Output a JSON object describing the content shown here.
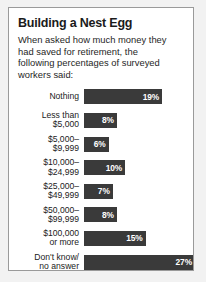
{
  "card": {
    "title": "Building a Nest Egg",
    "subtitle_lines": [
      "When asked how much money they",
      "had saved for retirement, the",
      "following percentages of surveyed",
      "workers said:"
    ]
  },
  "colors": {
    "bar_fill": "#3a3a3a",
    "card_background": "#ffffff",
    "card_border": "#9a9a9a",
    "page_background": "#f2f2f2",
    "value_text": "#ffffff",
    "label_text": "#1b1b1b"
  },
  "chart_data": {
    "type": "bar",
    "orientation": "horizontal",
    "title": "Building a Nest Egg",
    "subtitle": "When asked how much money they had saved for retirement, the following percentages of surveyed workers said:",
    "xlabel": "",
    "ylabel": "",
    "xlim": [
      0,
      27
    ],
    "grid": false,
    "legend": false,
    "value_suffix": "%",
    "categories": [
      "Nothing",
      "Less than $5,000",
      "$5,000–$9,999",
      "$10,000–$24,999",
      "$25,000–$49,999",
      "$50,000–$99,999",
      "$100,000 or more",
      "Don't know/ no answer"
    ],
    "values": [
      19,
      8,
      6,
      10,
      7,
      8,
      15,
      27
    ],
    "value_labels": [
      "19%",
      "8%",
      "6%",
      "10%",
      "7%",
      "8%",
      "15%",
      "27%"
    ],
    "rows": [
      {
        "label_lines": [
          "Nothing"
        ],
        "value": 19,
        "value_label": "19%"
      },
      {
        "label_lines": [
          "Less than",
          "$5,000"
        ],
        "value": 8,
        "value_label": "8%"
      },
      {
        "label_lines": [
          "$5,000–",
          "$9,999"
        ],
        "value": 6,
        "value_label": "6%"
      },
      {
        "label_lines": [
          "$10,000–",
          "$24,999"
        ],
        "value": 10,
        "value_label": "10%"
      },
      {
        "label_lines": [
          "$25,000–",
          "$49,999"
        ],
        "value": 7,
        "value_label": "7%"
      },
      {
        "label_lines": [
          "$50,000–",
          "$99,999"
        ],
        "value": 8,
        "value_label": "8%"
      },
      {
        "label_lines": [
          "$100,000",
          "or more"
        ],
        "value": 15,
        "value_label": "15%"
      },
      {
        "label_lines": [
          "Don't know/",
          "no answer"
        ],
        "value": 27,
        "value_label": "27%"
      }
    ]
  }
}
